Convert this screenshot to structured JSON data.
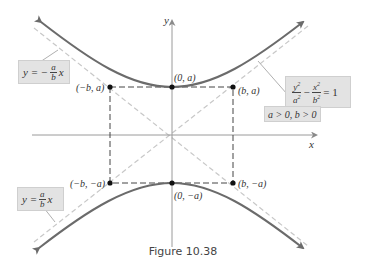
{
  "figure": {
    "caption": "Figure 10.38",
    "axes": {
      "x_label": "x",
      "y_label": "y"
    },
    "points": [
      {
        "id": "neg-b-a",
        "label": "(−b, a)"
      },
      {
        "id": "zero-a",
        "label": "(0, a)"
      },
      {
        "id": "b-a",
        "label": "(b, a)"
      },
      {
        "id": "neg-b-neg-a",
        "label": "(−b, −a)"
      },
      {
        "id": "zero-neg-a",
        "label": "(0, −a)"
      },
      {
        "id": "b-neg-a",
        "label": "(b, −a)"
      }
    ],
    "asymptote_neg": {
      "lhs": "y = −",
      "num": "a",
      "den": "b",
      "rhs": "x"
    },
    "asymptote_pos": {
      "lhs": "y =",
      "num": "a",
      "den": "b",
      "rhs": "x"
    },
    "equation": {
      "term1_num": "y",
      "term1_den": "a",
      "minus": "−",
      "term2_num": "x",
      "term2_den": "b",
      "sq": "2",
      "rhs": "= 1",
      "condition": "a > 0, b > 0"
    },
    "colors": {
      "curve": "#6b6b6b",
      "asymptote": "#c8c8c8",
      "axis": "#9a9a9a",
      "dashed_box": "#444444",
      "label_bg": "#e3e3e3"
    }
  }
}
